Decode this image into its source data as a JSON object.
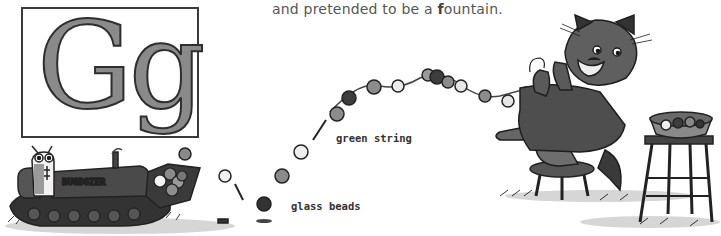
{
  "letter_box": {
    "uppercase": "G",
    "lowercase": "g"
  },
  "narration": {
    "prefix": "and pretended to be a ",
    "highlight": "f",
    "suffix": "ountain."
  },
  "labels": {
    "string": "green string",
    "beads": "glass beads"
  },
  "illustration": {
    "vehicle_text": "BUGDOZER",
    "scene": "Bug driving a bulldozer scooping glass beads; a cat on a stool strings beads on a green string; bowl of beads on a tall stool"
  },
  "colors": {
    "ink": "#2e2e2e",
    "letter_fill": "#8a8a8a",
    "text": "#555555",
    "bead_dark": "#3d3d3d",
    "bead_mid": "#8c8c8c",
    "bead_light": "#e8e8e8"
  }
}
